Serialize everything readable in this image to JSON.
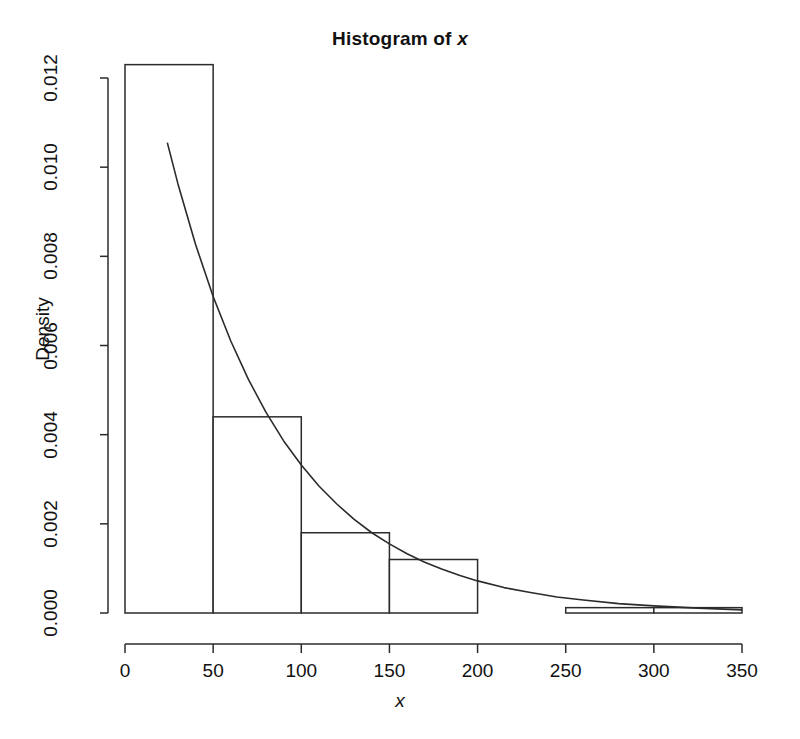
{
  "chart_data": {
    "type": "bar",
    "title": "Histogram of x",
    "title_plain": "Histogram of ",
    "title_variable": "x",
    "xlabel": "x",
    "ylabel": "Density",
    "grid": false,
    "legend": "none",
    "xlim": [
      0,
      350
    ],
    "ylim": [
      0,
      0.0125
    ],
    "binwidth": 50,
    "bin_edges": [
      0,
      50,
      100,
      150,
      200,
      250,
      300,
      350
    ],
    "categories": [
      "0-50",
      "50-100",
      "100-150",
      "150-200",
      "200-250",
      "250-300",
      "300-350"
    ],
    "values": [
      0.0123,
      0.0044,
      0.0018,
      0.0012,
      0.0,
      0.00012,
      0.00012
    ],
    "xticks": [
      0,
      50,
      100,
      150,
      200,
      250,
      300,
      350
    ],
    "xtick_labels": [
      "0",
      "50",
      "100",
      "150",
      "200",
      "250",
      "300",
      "350"
    ],
    "yticks": [
      0.0,
      0.002,
      0.004,
      0.006,
      0.008,
      0.01,
      0.012
    ],
    "ytick_labels": [
      "0.000",
      "0.002",
      "0.004",
      "0.006",
      "0.008",
      "0.010",
      "0.012"
    ],
    "overlay": {
      "type": "line",
      "name": "fitted exponential density curve",
      "form": "exponential",
      "rate": 0.0152,
      "amplitude": 0.0152,
      "x_start": 24,
      "x_end": 350,
      "points_x": [
        24,
        30,
        40,
        50,
        60,
        70,
        80,
        90,
        100,
        110,
        120,
        130,
        140,
        150,
        160,
        170,
        180,
        190,
        200,
        215,
        230,
        245,
        260,
        280,
        300,
        325,
        350
      ],
      "points_y": [
        0.01055,
        0.00963,
        0.00827,
        0.0071,
        0.0061,
        0.00524,
        0.0045,
        0.00386,
        0.00332,
        0.00285,
        0.00245,
        0.0021,
        0.0018,
        0.00155,
        0.00133,
        0.00114,
        0.00098,
        0.00084,
        0.00072,
        0.00057,
        0.00046,
        0.00036,
        0.00029,
        0.00021,
        0.00016,
        0.00011,
        7e-05
      ]
    },
    "colors": {
      "axis": "#2b2b2b",
      "bar_border": "#2b2b2b",
      "bar_fill": "#ffffff",
      "curve": "#2b2b2b",
      "background": "#ffffff",
      "text": "#111111"
    }
  }
}
